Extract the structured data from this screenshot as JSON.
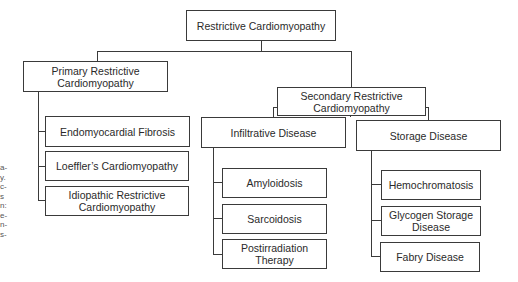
{
  "diagram": {
    "root": {
      "label": "Restrictive Cardiomyopathy"
    },
    "primary": {
      "label": "Primary Restrictive Cardiomyopathy",
      "children": [
        {
          "label": "Endomyocardial Fibrosis"
        },
        {
          "label": "Loeffler’s Cardiomyopathy"
        },
        {
          "label": "Idiopathic Restrictive Cardiomyopathy"
        }
      ]
    },
    "secondary": {
      "label": "Secondary Restrictive Cardiomyopathy",
      "groups": [
        {
          "label": "Infiltrative Disease",
          "children": [
            {
              "label": "Amyloidosis"
            },
            {
              "label": "Sarcoidosis"
            },
            {
              "label": "Postirradiation Therapy"
            }
          ]
        },
        {
          "label": "Storage Disease",
          "children": [
            {
              "label": "Hemochromatosis"
            },
            {
              "label": "Glycogen Storage Disease"
            },
            {
              "label": "Fabry Disease"
            }
          ]
        }
      ]
    }
  },
  "margin_fragments": [
    "a-",
    "y.",
    "c-",
    "s",
    "n:",
    "e-",
    "n-",
    "s-"
  ]
}
